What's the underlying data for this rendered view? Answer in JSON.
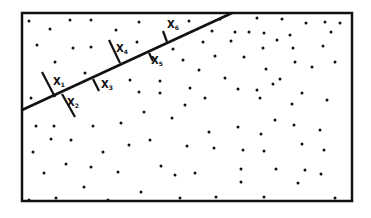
{
  "diagram": {
    "frame": {
      "x": 22,
      "y": 13,
      "w": 330,
      "h": 188,
      "stroke": "#111111"
    },
    "boundary_line": {
      "x1": 22,
      "y1": 110,
      "x2": 232,
      "y2": 13
    },
    "transects": [
      {
        "label": "X",
        "sub": "1",
        "x1": 42,
        "y1": 72,
        "x2": 55,
        "y2": 97,
        "lx": 53,
        "ly": 85
      },
      {
        "label": "X",
        "sub": "2",
        "x1": 62,
        "y1": 94,
        "x2": 75,
        "y2": 117,
        "lx": 67,
        "ly": 106
      },
      {
        "label": "X",
        "sub": "3",
        "x1": 93,
        "y1": 79,
        "x2": 99,
        "y2": 91,
        "lx": 101,
        "ly": 88
      },
      {
        "label": "X",
        "sub": "4",
        "x1": 109,
        "y1": 40,
        "x2": 120,
        "y2": 63,
        "lx": 116,
        "ly": 52
      },
      {
        "label": "X",
        "sub": "5",
        "x1": 149,
        "y1": 53,
        "x2": 153,
        "y2": 61,
        "lx": 151,
        "ly": 64
      },
      {
        "label": "X",
        "sub": "6",
        "x1": 163,
        "y1": 31,
        "x2": 167,
        "y2": 42,
        "lx": 167,
        "ly": 28
      }
    ],
    "dots": [
      [
        29,
        21
      ],
      [
        50,
        29
      ],
      [
        70,
        20
      ],
      [
        91,
        20
      ],
      [
        116,
        30
      ],
      [
        139,
        22
      ],
      [
        37,
        45
      ],
      [
        73,
        48
      ],
      [
        91,
        47
      ],
      [
        137,
        42
      ],
      [
        173,
        49
      ],
      [
        183,
        60
      ],
      [
        55,
        62
      ],
      [
        85,
        73
      ],
      [
        130,
        80
      ],
      [
        160,
        81
      ],
      [
        31,
        98
      ],
      [
        139,
        92
      ],
      [
        160,
        93
      ],
      [
        189,
        21
      ],
      [
        212,
        31
      ],
      [
        220,
        19
      ],
      [
        235,
        32
      ],
      [
        257,
        18
      ],
      [
        249,
        32
      ],
      [
        264,
        33
      ],
      [
        282,
        19
      ],
      [
        290,
        35
      ],
      [
        306,
        23
      ],
      [
        325,
        22
      ],
      [
        331,
        32
      ],
      [
        340,
        23
      ],
      [
        277,
        40
      ],
      [
        203,
        42
      ],
      [
        231,
        41
      ],
      [
        263,
        48
      ],
      [
        293,
        48
      ],
      [
        323,
        46
      ],
      [
        215,
        56
      ],
      [
        244,
        57
      ],
      [
        295,
        62
      ],
      [
        312,
        67
      ],
      [
        335,
        62
      ],
      [
        199,
        70
      ],
      [
        266,
        69
      ],
      [
        225,
        78
      ],
      [
        280,
        79
      ],
      [
        190,
        88
      ],
      [
        238,
        89
      ],
      [
        257,
        90
      ],
      [
        273,
        84
      ],
      [
        205,
        98
      ],
      [
        260,
        98
      ],
      [
        302,
        93
      ],
      [
        185,
        105
      ],
      [
        292,
        104
      ],
      [
        327,
        100
      ],
      [
        36,
        126
      ],
      [
        54,
        126
      ],
      [
        93,
        126
      ],
      [
        121,
        123
      ],
      [
        144,
        112
      ],
      [
        172,
        118
      ],
      [
        51,
        139
      ],
      [
        71,
        140
      ],
      [
        129,
        145
      ],
      [
        150,
        140
      ],
      [
        33,
        152
      ],
      [
        103,
        152
      ],
      [
        66,
        164
      ],
      [
        91,
        167
      ],
      [
        118,
        172
      ],
      [
        161,
        166
      ],
      [
        175,
        175
      ],
      [
        44,
        173
      ],
      [
        84,
        187
      ],
      [
        141,
        192
      ],
      [
        29,
        200
      ],
      [
        56,
        198
      ],
      [
        108,
        200
      ],
      [
        180,
        198
      ],
      [
        209,
        132
      ],
      [
        238,
        127
      ],
      [
        275,
        120
      ],
      [
        261,
        134
      ],
      [
        294,
        125
      ],
      [
        320,
        130
      ],
      [
        187,
        146
      ],
      [
        214,
        148
      ],
      [
        243,
        150
      ],
      [
        264,
        151
      ],
      [
        302,
        144
      ],
      [
        324,
        150
      ],
      [
        195,
        173
      ],
      [
        241,
        169
      ],
      [
        276,
        169
      ],
      [
        305,
        170
      ],
      [
        321,
        174
      ],
      [
        241,
        182
      ],
      [
        298,
        183
      ],
      [
        216,
        197
      ],
      [
        264,
        197
      ],
      [
        335,
        198
      ]
    ]
  }
}
